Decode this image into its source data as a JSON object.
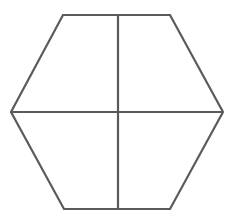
{
  "diagram": {
    "shape": "hexagon",
    "stroke_color": "#5a5a5a",
    "background": "#ffffff",
    "vertices": [
      [
        63,
        15
      ],
      [
        170,
        15
      ],
      [
        223,
        112
      ],
      [
        170,
        209
      ],
      [
        64,
        209
      ],
      [
        11,
        112
      ]
    ],
    "dividers": {
      "vertical": [
        [
          118,
          15
        ],
        [
          118,
          209
        ]
      ],
      "horizontal": [
        [
          11,
          112
        ],
        [
          223,
          112
        ]
      ]
    },
    "regions": 4
  }
}
